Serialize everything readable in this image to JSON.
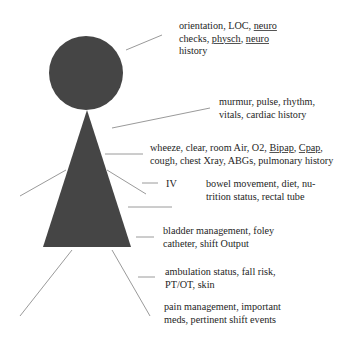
{
  "diagram": {
    "title": "",
    "figure_color": "#454545",
    "line_color": "#9a9a9a",
    "background": "#ffffff",
    "labels": {
      "neuro": {
        "lines": [
          [
            {
              "t": "orientation, LOC, "
            },
            {
              "t": "neuro",
              "u": true
            }
          ],
          [
            {
              "t": "checks, "
            },
            {
              "t": "physch",
              "u": true
            },
            {
              "t": ", "
            },
            {
              "t": "neuro",
              "u": true
            }
          ],
          [
            {
              "t": "history"
            }
          ]
        ]
      },
      "cardiac": {
        "lines": [
          [
            {
              "t": "murmur, pulse, rhythm,"
            }
          ],
          [
            {
              "t": "vitals, cardiac history"
            }
          ]
        ]
      },
      "pulmonary": {
        "lines": [
          [
            {
              "t": "wheeze, clear, room Air, O2, "
            },
            {
              "t": "Bipap",
              "u": true
            },
            {
              "t": ", "
            },
            {
              "t": "Cpap",
              "u": true
            },
            {
              "t": ","
            }
          ],
          [
            {
              "t": "cough, chest Xray, ABGs, pulmonary history"
            }
          ]
        ]
      },
      "iv": {
        "lines": [
          [
            {
              "t": "IV"
            }
          ]
        ]
      },
      "gi": {
        "lines": [
          [
            {
              "t": "bowel movement, diet, nu-"
            }
          ],
          [
            {
              "t": "trition status, rectal tube"
            }
          ]
        ]
      },
      "gu": {
        "lines": [
          [
            {
              "t": "bladder management, foley"
            }
          ],
          [
            {
              "t": "catheter, shift Output"
            }
          ]
        ]
      },
      "mobility": {
        "lines": [
          [
            {
              "t": "ambulation status, fall risk,"
            }
          ],
          [
            {
              "t": "PT/OT, skin"
            }
          ]
        ]
      },
      "pain": {
        "lines": [
          [
            {
              "t": "pain management, important"
            }
          ],
          [
            {
              "t": "meds, pertinent shift events"
            }
          ]
        ]
      }
    }
  }
}
